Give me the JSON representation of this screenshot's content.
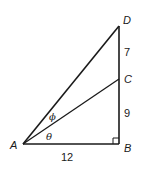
{
  "diagram": {
    "type": "right-triangle-geometry",
    "points": {
      "A": {
        "label": "A",
        "x": 23,
        "y": 144
      },
      "B": {
        "label": "B",
        "x": 119,
        "y": 144
      },
      "C": {
        "label": "C",
        "x": 119,
        "y": 79
      },
      "D": {
        "label": "D",
        "x": 119,
        "y": 26
      }
    },
    "segments": [
      {
        "from": "A",
        "to": "B",
        "length_label": "12"
      },
      {
        "from": "B",
        "to": "C",
        "length_label": "9"
      },
      {
        "from": "C",
        "to": "D",
        "length_label": "7"
      },
      {
        "from": "A",
        "to": "C",
        "length_label": ""
      },
      {
        "from": "A",
        "to": "D",
        "length_label": ""
      }
    ],
    "angles": [
      {
        "label": "θ",
        "between": [
          "AB",
          "AC"
        ]
      },
      {
        "label": "ϕ",
        "between": [
          "AC",
          "AD"
        ]
      }
    ],
    "right_angle_at": "B",
    "labels": {
      "A": "A",
      "B": "B",
      "C": "C",
      "D": "D",
      "AB": "12",
      "BC": "9",
      "CD": "7",
      "theta": "θ",
      "phi": "ϕ"
    },
    "colors": {
      "line": "#1a1a1a",
      "background": "#ffffff"
    }
  }
}
